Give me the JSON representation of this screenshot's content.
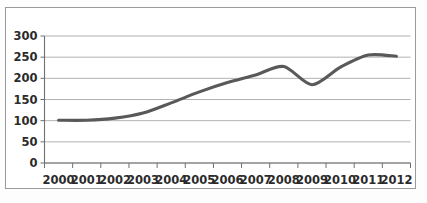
{
  "chart_data": {
    "type": "line",
    "title": "",
    "subtitle": "",
    "xlabel": "",
    "ylabel": "",
    "categories": [
      "2000",
      "2001",
      "2002",
      "2003",
      "2004",
      "2005",
      "2006",
      "2007",
      "2008",
      "2009",
      "2010",
      "2011",
      "2012"
    ],
    "values": [
      101,
      101,
      106,
      118,
      142,
      168,
      190,
      208,
      228,
      185,
      226,
      255,
      252
    ],
    "series": [
      {
        "name": "",
        "values": [
          101,
          101,
          106,
          118,
          142,
          168,
          190,
          208,
          228,
          185,
          226,
          255,
          252
        ]
      }
    ],
    "ylim": [
      0,
      300
    ],
    "ytick_labels": [
      "0",
      "50",
      "100",
      "150",
      "200",
      "250",
      "300"
    ],
    "ytick_values": [
      0,
      50,
      100,
      150,
      200,
      250,
      300
    ],
    "grid": true,
    "grid_axis": "y",
    "legend": false,
    "legend_position": "none",
    "annotations": [],
    "colors": {
      "line": "#595959",
      "gridline": "#a9a9a9",
      "axis": "#6f6f6f",
      "text": "#2b2b2b",
      "plot_background": "#ffffff",
      "figure_border": "#9a9a9a"
    }
  }
}
